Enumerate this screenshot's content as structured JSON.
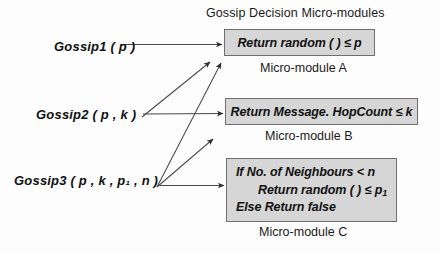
{
  "diagram": {
    "title": "Gossip Decision Micro-modules",
    "modules": [
      {
        "id": "A",
        "caption": "Micro-module A",
        "lines": [
          "Return random ( ) ≤ p"
        ]
      },
      {
        "id": "B",
        "caption": "Micro-module B",
        "lines": [
          "Return Message. HopCount ≤ k"
        ]
      },
      {
        "id": "C",
        "caption": "Micro-module C",
        "lines": [
          "If No. of Neighbours < n",
          "Return random ( ) ≤ p",
          "Else Return false"
        ],
        "line2_subscript": "1"
      }
    ],
    "calls": [
      {
        "id": "gossip1",
        "label": "Gossip1 ( p )",
        "targets": [
          "A"
        ]
      },
      {
        "id": "gossip2",
        "label": "Gossip2 ( p , k )",
        "targets": [
          "A",
          "B"
        ]
      },
      {
        "id": "gossip3",
        "label": "Gossip3 ( p , k , p₁ , n )",
        "targets": [
          "A",
          "B",
          "C"
        ]
      }
    ],
    "colors": {
      "box_fill": "#d6d6d6",
      "box_border": "#6f6f6f",
      "text": "#111111",
      "arrow": "#3a3a3a",
      "background": "#fdfdfd"
    }
  }
}
